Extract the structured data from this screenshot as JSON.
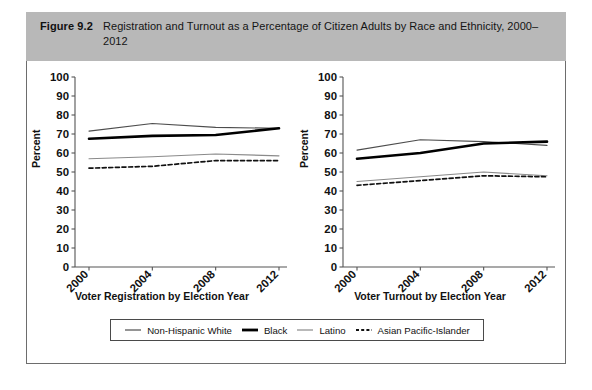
{
  "caption": {
    "label": "Figure 9.2",
    "text": "Registration and Turnout as a Percentage of Citizen Adults by Race and Ethnicity, 2000–2012"
  },
  "legend": {
    "items": [
      {
        "label": "Non-Hispanic White",
        "style": "thin-solid",
        "color": "#4d4d4d"
      },
      {
        "label": "Black",
        "style": "thick-solid",
        "color": "#000000"
      },
      {
        "label": "Latino",
        "style": "thin-solid",
        "color": "#8a8a8a"
      },
      {
        "label": "Asian Pacific-Islander",
        "style": "dashed",
        "color": "#111111"
      }
    ]
  },
  "colors": {
    "caption_bar": "#b8b8b8",
    "panel_border": "#6d6d6d",
    "axis": "#555555",
    "non_hispanic_white": "#4d4d4d",
    "black": "#000000",
    "latino": "#8a8a8a",
    "asian_pacific_islander": "#111111"
  },
  "chart_data": [
    {
      "type": "line",
      "title": "",
      "xlabel": "Voter Registration by Election Year",
      "ylabel": "Percent",
      "categories": [
        "2000",
        "2004",
        "2008",
        "2012"
      ],
      "ylim": [
        0,
        100
      ],
      "yticks": [
        0,
        10,
        20,
        30,
        40,
        50,
        60,
        70,
        80,
        90,
        100
      ],
      "grid": false,
      "legend_position": "bottom",
      "series": [
        {
          "name": "Non-Hispanic White",
          "values": [
            71.5,
            75.5,
            73.5,
            73.0
          ]
        },
        {
          "name": "Black",
          "values": [
            67.5,
            69.0,
            69.5,
            73.0
          ]
        },
        {
          "name": "Latino",
          "values": [
            57.0,
            58.0,
            59.5,
            58.5
          ]
        },
        {
          "name": "Asian Pacific-Islander",
          "values": [
            52.0,
            53.0,
            56.0,
            56.0
          ]
        }
      ]
    },
    {
      "type": "line",
      "title": "",
      "xlabel": "Voter Turnout by Election Year",
      "ylabel": "Percent",
      "categories": [
        "2000",
        "2004",
        "2008",
        "2012"
      ],
      "ylim": [
        0,
        100
      ],
      "yticks": [
        0,
        10,
        20,
        30,
        40,
        50,
        60,
        70,
        80,
        90,
        100
      ],
      "grid": false,
      "legend_position": "bottom",
      "series": [
        {
          "name": "Non-Hispanic White",
          "values": [
            61.5,
            67.0,
            66.0,
            64.0
          ]
        },
        {
          "name": "Black",
          "values": [
            57.0,
            60.0,
            65.0,
            66.0
          ]
        },
        {
          "name": "Latino",
          "values": [
            45.0,
            47.5,
            50.0,
            48.0
          ]
        },
        {
          "name": "Asian Pacific-Islander",
          "values": [
            43.0,
            45.5,
            48.0,
            47.5
          ]
        }
      ]
    }
  ]
}
